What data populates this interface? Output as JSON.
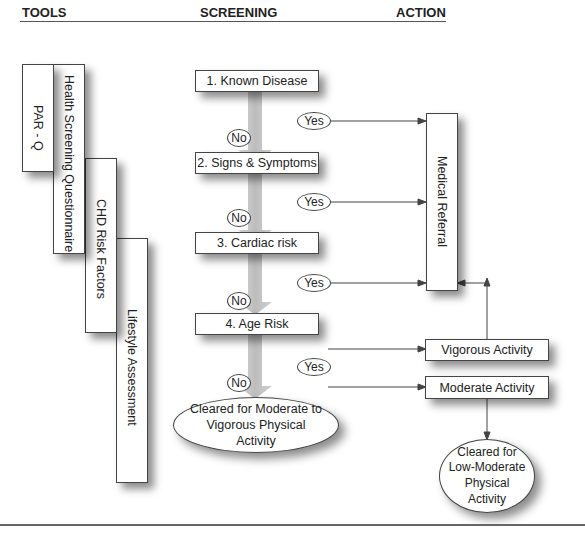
{
  "headers": {
    "tools": "TOOLS",
    "screening": "SCREENING",
    "action": "ACTION"
  },
  "tools": [
    {
      "label": "PAR - Q"
    },
    {
      "label": "Health Screening Questionnaire"
    },
    {
      "label": "CHD Risk Factors"
    },
    {
      "label": "Lifestyle Assessment"
    }
  ],
  "screening": {
    "steps": [
      {
        "label": "1. Known Disease"
      },
      {
        "label": "2. Signs & Symptoms"
      },
      {
        "label": "3. Cardiac risk"
      },
      {
        "label": "4. Age Risk"
      }
    ],
    "no_label": "No",
    "yes_label": "Yes",
    "cleared": "Cleared for Moderate to Vigorous Physical Activity"
  },
  "action": {
    "medical_referral": "Medical Referral",
    "vigorous": "Vigorous Activity",
    "moderate": "Moderate Activity",
    "cleared_low": "Cleared for Low-Moderate Physical Activity"
  },
  "colors": {
    "arrow_fill": "#c8c8c8",
    "line": "#444444"
  }
}
